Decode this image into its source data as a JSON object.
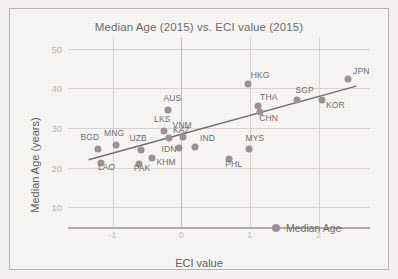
{
  "chart_data": {
    "type": "scatter",
    "title": "Median Age (2015) vs. ECI value (2015)",
    "xlabel": "ECI value",
    "ylabel": "Median Age (years)",
    "xlim": [
      -1.65,
      2.75
    ],
    "ylim": [
      5,
      53
    ],
    "xticks": [
      "-1",
      "0",
      "1",
      "2"
    ],
    "xtick_values": [
      -1,
      0,
      1,
      2
    ],
    "yticks": [
      "50",
      "40",
      "30",
      "20",
      "10"
    ],
    "ytick_values": [
      50,
      40,
      30,
      20,
      10
    ],
    "grid": true,
    "legend": [
      {
        "label": "Median Age",
        "color": "#9c8f92",
        "marker": "circle"
      }
    ],
    "legend_position": "bottom-right",
    "point_color": "#9c8f92",
    "trendline": {
      "visible": true,
      "color": "#6e6a69",
      "x_start": -1.35,
      "y_start": 22.0,
      "x_end": 2.55,
      "y_end": 40.6
    },
    "points": [
      {
        "label": "BGD",
        "x": -1.22,
        "y": 24.6,
        "label_dx": -17,
        "label_dy": -11
      },
      {
        "label": "LAO",
        "x": -1.17,
        "y": 21.2,
        "label_dx": -3,
        "label_dy": 5
      },
      {
        "label": "MNG",
        "x": -0.95,
        "y": 25.6,
        "label_dx": -12,
        "label_dy": -11
      },
      {
        "label": "PAK",
        "x": -0.62,
        "y": 21.0,
        "label_dx": -5,
        "label_dy": 5
      },
      {
        "label": "UZB",
        "x": -0.58,
        "y": 24.5,
        "label_dx": -12,
        "label_dy": -11
      },
      {
        "label": "KHM",
        "x": -0.42,
        "y": 22.4,
        "label_dx": 4,
        "label_dy": 5
      },
      {
        "label": "LKS",
        "x": -0.25,
        "y": 29.3,
        "label_dx": -10,
        "label_dy": -11
      },
      {
        "label": "KAZ",
        "x": -0.18,
        "y": 27.6,
        "label_dx": 4,
        "label_dy": -7
      },
      {
        "label": "AUS",
        "x": -0.2,
        "y": 34.6,
        "label_dx": -4,
        "label_dy": -11
      },
      {
        "label": "IDN",
        "x": -0.04,
        "y": 24.9,
        "label_dx": -17,
        "label_dy": 2
      },
      {
        "label": "VNM",
        "x": 0.02,
        "y": 27.7,
        "label_dx": -10,
        "label_dy": -11
      },
      {
        "label": "IND",
        "x": 0.2,
        "y": 25.2,
        "label_dx": 5,
        "label_dy": -8
      },
      {
        "label": "PHL",
        "x": 0.7,
        "y": 22.1,
        "label_dx": -4,
        "label_dy": 6
      },
      {
        "label": "MYS",
        "x": 0.98,
        "y": 24.7,
        "label_dx": -3,
        "label_dy": -10
      },
      {
        "label": "HKG",
        "x": 0.97,
        "y": 41.1,
        "label_dx": 3,
        "label_dy": -8
      },
      {
        "label": "THA",
        "x": 1.12,
        "y": 35.5,
        "label_dx": 2,
        "label_dy": -8
      },
      {
        "label": "CHN",
        "x": 1.15,
        "y": 34.1,
        "label_dx": -1,
        "label_dy": 7
      },
      {
        "label": "SGP",
        "x": 1.68,
        "y": 37.0,
        "label_dx": -1,
        "label_dy": -9
      },
      {
        "label": "KOR",
        "x": 2.05,
        "y": 37.1,
        "label_dx": 4,
        "label_dy": 6
      },
      {
        "label": "JPN",
        "x": 2.43,
        "y": 42.4,
        "label_dx": 5,
        "label_dy": -7
      }
    ]
  }
}
